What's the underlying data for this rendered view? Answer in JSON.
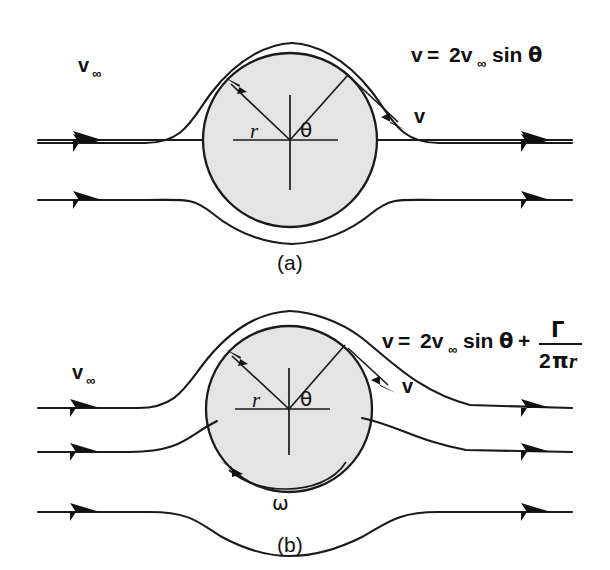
{
  "figure": {
    "background_color": "#ffffff",
    "ink_color": "#1a1a1a",
    "body_fill_color": "#e4e4e4"
  },
  "panels": [
    {
      "id": "a",
      "caption": "(a)",
      "freestream_label": "v",
      "freestream_subscript": "∞",
      "equation": {
        "lhs": "v",
        "equals": "=",
        "coefficient": "2v",
        "coefficient_subscript": "∞",
        "function": "sin",
        "angle": "θ",
        "full_text": "v = 2v∞ sin θ"
      },
      "radius_label": "r",
      "angle_label": "θ",
      "velocity_label": "v",
      "streamline_count": 3,
      "symmetric": true
    },
    {
      "id": "b",
      "caption": "(b)",
      "freestream_label": "v",
      "freestream_subscript": "∞",
      "equation": {
        "lhs": "v",
        "equals": "=",
        "coefficient": "2v",
        "coefficient_subscript": "∞",
        "function": "sin",
        "angle": "θ",
        "plus": "+",
        "numerator": "Γ",
        "denominator_num": "2",
        "denominator_pi": "π",
        "denominator_r": "r",
        "full_text": "v = 2v∞ sin θ + Γ/(2πr)"
      },
      "radius_label": "r",
      "angle_label": "θ",
      "velocity_label": "v",
      "rotation_label": "ω",
      "streamline_count": 3,
      "symmetric": false
    }
  ]
}
